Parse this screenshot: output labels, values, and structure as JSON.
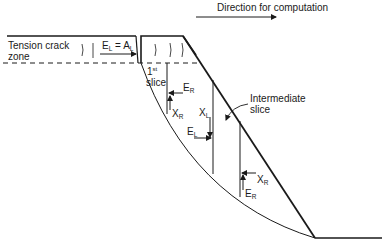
{
  "diagram": {
    "direction_label": "Direction for computation",
    "tension_crack_zone": {
      "line1": "Tension crack",
      "line2": "zone"
    },
    "first_slice": {
      "ordinal": "1",
      "ordinal_suffix": "st",
      "word": "slice"
    },
    "boundary_equation": {
      "E": "E",
      "E_sub": "L",
      "eq": " = ",
      "A": "A",
      "A_sub": "L"
    },
    "intermediate_slice": {
      "line1": "Intermediate",
      "line2": "slice"
    },
    "forces": {
      "first_slice_right_E": {
        "main": "E",
        "sub": "R"
      },
      "first_slice_right_X": {
        "main": "X",
        "sub": "R"
      },
      "intermediate_left_X": {
        "main": "X",
        "sub": "L"
      },
      "intermediate_left_E": {
        "main": "E",
        "sub": "L"
      },
      "intermediate_right_X": {
        "main": "X",
        "sub": "R"
      },
      "intermediate_right_E": {
        "main": "E",
        "sub": "R"
      }
    },
    "colors": {
      "line": "#1a1a1a",
      "background": "#ffffff"
    }
  }
}
